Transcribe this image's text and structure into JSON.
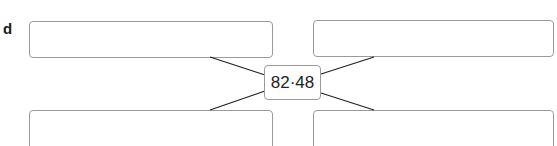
{
  "question": {
    "label": "d",
    "center_value": "82·48",
    "answer_boxes": [
      {
        "position": "top-left",
        "value": ""
      },
      {
        "position": "top-right",
        "value": ""
      },
      {
        "position": "bottom-left",
        "value": ""
      },
      {
        "position": "bottom-right",
        "value": ""
      }
    ]
  },
  "colors": {
    "box_border": "#9a9a9a",
    "line": "#222222",
    "text": "#222222"
  }
}
